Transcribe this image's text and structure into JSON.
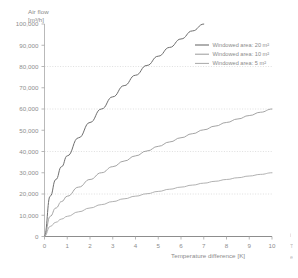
{
  "chart_data": {
    "type": "line",
    "title": "",
    "ylabel": "Air flow\n[m³/h]",
    "ylabel_line1": "Air flow",
    "ylabel_line2": "[m³/h]",
    "xlabel": "Temperature difference [K]",
    "xlim": [
      0,
      10
    ],
    "ylim": [
      0,
      100000
    ],
    "grid": "horizontal-dotted",
    "gridlines_y": [
      20000,
      40000,
      60000,
      80000
    ],
    "legend_position": "top-right-inside",
    "xticks": [
      "0",
      "1",
      "2",
      "3",
      "4",
      "5",
      "6",
      "7",
      "8",
      "9",
      "10"
    ],
    "xtick_values": [
      0,
      1,
      2,
      3,
      4,
      5,
      6,
      7,
      8,
      9,
      10
    ],
    "yticks": [
      "0",
      "10,000",
      "20,000",
      "30,000",
      "40,000",
      "50,000",
      "60,000",
      "70,000",
      "80,000",
      "90,000",
      "100,000"
    ],
    "ytick_values": [
      0,
      10000,
      20000,
      30000,
      40000,
      50000,
      60000,
      70000,
      80000,
      90000,
      100000
    ],
    "x": [
      0,
      0.25,
      0.5,
      0.75,
      1,
      1.5,
      2,
      2.5,
      3,
      3.5,
      4,
      4.5,
      5,
      5.5,
      6,
      6.5,
      7,
      7.5,
      8,
      8.5,
      9,
      9.5,
      10
    ],
    "series": [
      {
        "name": "Windowed area: 20 m²",
        "color": "#6e6e6e",
        "width": 1.0,
        "x_end": 7.0,
        "values": [
          0,
          18974,
          26833,
          32863,
          37947,
          46476,
          53666,
          60000,
          65727,
          70993,
          75895,
          80498,
          84853,
          88994,
          92951,
          96746,
          100000,
          null,
          null,
          null,
          null,
          null,
          null
        ]
      },
      {
        "name": "Windowed area: 10 m²",
        "color": "#9a9a9a",
        "width": 0.9,
        "x_end": 10.0,
        "values": [
          0,
          9487,
          13416,
          16432,
          18974,
          23238,
          26833,
          30000,
          32863,
          35496,
          37947,
          40249,
          42426,
          44497,
          46476,
          48373,
          50200,
          51962,
          53666,
          55317,
          56921,
          58481,
          60000
        ]
      },
      {
        "name": "Windowed area:  5 m²",
        "color": "#a8a8a8",
        "width": 0.9,
        "x_end": 10.0,
        "values": [
          0,
          4743,
          6708,
          8216,
          9487,
          11619,
          13416,
          15000,
          16432,
          17748,
          18974,
          20125,
          21213,
          22249,
          23238,
          24187,
          25100,
          25981,
          26833,
          27659,
          28461,
          29240,
          30000
        ]
      }
    ]
  },
  "legend": {
    "items": [
      {
        "label": "Windowed area: 20 m²"
      },
      {
        "label": "Windowed area: 10 m²"
      },
      {
        "label": "Windowed area:  5 m²"
      }
    ]
  },
  "margin_notes": {
    "line1": "i",
    "line2": "T",
    "line3": "e"
  }
}
